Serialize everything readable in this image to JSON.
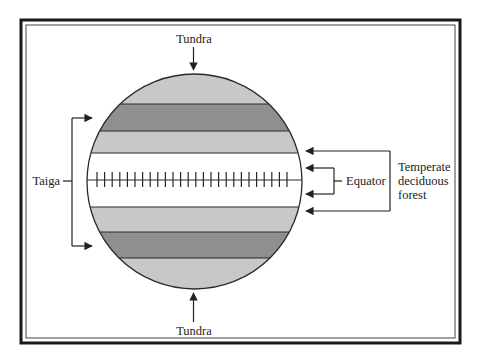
{
  "diagram": {
    "type": "earth-biome-bands",
    "labels": {
      "tundra_top": "Tundra",
      "tundra_bottom": "Tundra",
      "taiga": "Taiga",
      "equator": "Equator",
      "temperate_line1": "Temperate",
      "temperate_line2": "deciduous",
      "temperate_line3": "forest"
    },
    "bands": [
      {
        "name": "tundra-north",
        "shade": "light"
      },
      {
        "name": "taiga-north",
        "shade": "dark"
      },
      {
        "name": "temperate-north",
        "shade": "light"
      },
      {
        "name": "equatorial",
        "shade": "white"
      },
      {
        "name": "temperate-south",
        "shade": "light"
      },
      {
        "name": "taiga-south",
        "shade": "dark"
      },
      {
        "name": "tundra-south",
        "shade": "light"
      }
    ],
    "colors": {
      "light_band": "#c8c8c8",
      "dark_band": "#8f8f8f",
      "equatorial_band": "#ffffff",
      "line": "#2a2a2a",
      "frame": "#1a1a1a"
    }
  }
}
